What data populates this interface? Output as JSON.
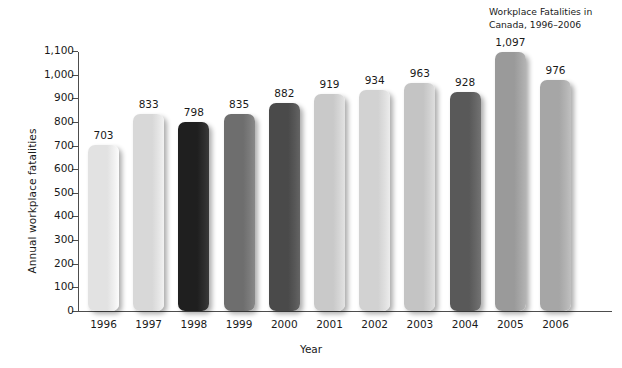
{
  "chart_data": {
    "type": "bar",
    "title": "Workplace Fatalities in\nCanada, 1996–2006",
    "xlabel": "Year",
    "ylabel": "Annual workplace fatalities",
    "categories": [
      "1996",
      "1997",
      "1998",
      "1999",
      "2000",
      "2001",
      "2002",
      "2003",
      "2004",
      "2005",
      "2006"
    ],
    "values": [
      703,
      833,
      798,
      835,
      882,
      919,
      934,
      963,
      928,
      1097,
      976
    ],
    "value_labels": [
      "703",
      "833",
      "798",
      "835",
      "882",
      "919",
      "934",
      "963",
      "928",
      "1,097",
      "976"
    ],
    "bar_colors": [
      "#e2e2e2",
      "#d8d8d8",
      "#1f1f1f",
      "#6e6e6e",
      "#4a4a4a",
      "#c9c9c9",
      "#d2d2d2",
      "#c4c4c4",
      "#595959",
      "#9a9a9a",
      "#a6a6a6"
    ],
    "ylim": [
      0,
      1100
    ],
    "ytick_values": [
      0,
      100,
      200,
      300,
      400,
      500,
      600,
      700,
      800,
      900,
      1000,
      1100
    ],
    "ytick_labels": [
      "0",
      "100",
      "200",
      "300",
      "400",
      "500",
      "600",
      "700",
      "800",
      "900",
      "1,000",
      "1,100"
    ],
    "grid": false,
    "legend": null,
    "axis_color": "#4d4d4d"
  }
}
